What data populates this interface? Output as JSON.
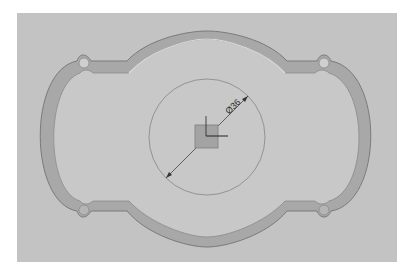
{
  "view": {
    "type": "CAD sketch view",
    "background_color": "#c3c3c3",
    "part_fill_color": "#c9c9c9",
    "edge_color": "#7a7a7a",
    "shadow_color": "#9e9e9e"
  },
  "dimension": {
    "label": "Ø36",
    "symbol": "diameter",
    "value": 36
  },
  "origin": {
    "name": "coordinate-origin",
    "axes": [
      "x",
      "y"
    ]
  }
}
